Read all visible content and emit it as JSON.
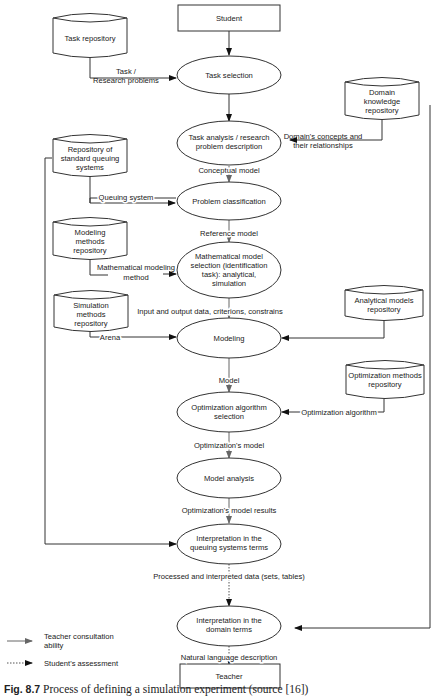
{
  "nodes": {
    "student": "Student",
    "teacher": "Teacher",
    "task_selection": "Task selection",
    "task_analysis": [
      "Task analysis / research",
      "problem description"
    ],
    "problem_classification": "Problem classification",
    "math_model_selection": [
      "Mathematical model",
      "selection (identification",
      "task): analytical,",
      "simulation"
    ],
    "modeling": "Modeling",
    "optimization_selection": [
      "Optimization algorithm",
      "selection"
    ],
    "model_analysis": "Model analysis",
    "interp_queuing": [
      "Interpretation in the",
      "queuing systems terms"
    ],
    "interp_domain": [
      "Interpretation in the",
      "domain terms"
    ]
  },
  "repositories": {
    "task": [
      "Task repository"
    ],
    "domain_knowledge": [
      "Domain",
      "knowledge",
      "repository"
    ],
    "standard_queuing": [
      "Repository of",
      "standard queuing",
      "systems"
    ],
    "modeling_methods": [
      "Modeling",
      "methods",
      "repository"
    ],
    "simulation_methods": [
      "Simulation",
      "methods",
      "repository"
    ],
    "analytical_models": [
      "Analytical models",
      "repository"
    ],
    "optimization_methods": [
      "Optimization methods",
      "repository"
    ]
  },
  "edge_labels": {
    "task_research": [
      "Task /",
      "Research problems"
    ],
    "domain_concepts": [
      "Domain's concepts and",
      "their relationships"
    ],
    "conceptual_model": "Conceptual model",
    "queuing_system": "Queuing system",
    "reference_model": "Reference model",
    "math_modeling_method": [
      "Mathematical modeling",
      "method"
    ],
    "io_data": "Input and output data, criterions, constrains",
    "arena": "Arena",
    "model": "Model",
    "optimization_algorithm": "Optimization algorithm",
    "optimizations_model": "Optimization's model",
    "optimizations_results": "Optimization's model results",
    "processed_data": "Processed and interpreted data (sets, tables)",
    "natural_language": "Natural language description"
  },
  "legend": {
    "teacher_consultation": [
      "Teacher consultation",
      "ability"
    ],
    "student_assessment": "Student's assessment"
  },
  "caption": {
    "label": "Fig. 8.7",
    "text": "Process of defining a simulation experiment (source [16])"
  },
  "colors": {
    "line": "#333333",
    "gray_arrow": "#666666"
  }
}
